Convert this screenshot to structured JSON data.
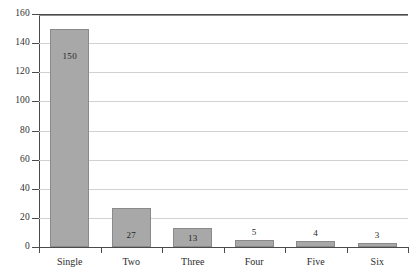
{
  "chart_data": {
    "type": "bar",
    "title": "",
    "subtitle": "",
    "xlabel": "",
    "ylabel": "",
    "categories": [
      "Single",
      "Two",
      "Three",
      "Four",
      "Five",
      "Six"
    ],
    "values": [
      150,
      27,
      13,
      5,
      4,
      3
    ],
    "value_labels": [
      "150",
      "27",
      "13",
      "5",
      "4",
      "3"
    ],
    "label_placement": [
      "inside",
      "inside",
      "inside",
      "above",
      "above",
      "above"
    ],
    "ylim": [
      0,
      160
    ],
    "ytick_labels": [
      "0",
      "20",
      "40",
      "60",
      "80",
      "100",
      "120",
      "140",
      "160"
    ],
    "ytick_values": [
      0,
      20,
      40,
      60,
      80,
      100,
      120,
      140,
      160
    ],
    "grid": true,
    "grid_axis": "y",
    "legend": false,
    "legend_position": "none",
    "colors": {
      "bar_fill": "#a8a8a8",
      "bar_border": "#8a8a8a",
      "gridline": "#d2d2d2",
      "axis": "#4a4a4a",
      "text": "#2b2b2b",
      "background": "#ffffff"
    }
  }
}
